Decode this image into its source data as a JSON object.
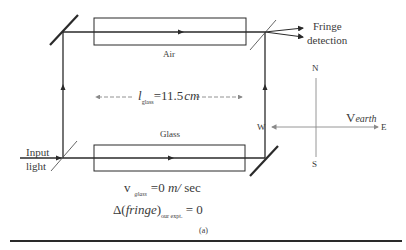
{
  "figure": {
    "labels": {
      "air": "Air",
      "glass": "Glass",
      "fringe_line1": "Fringe",
      "fringe_line2": "detection",
      "input_line1": "Input",
      "input_line2": "light",
      "length_symbol": "l",
      "length_sub": "glass",
      "length_value": "=11.5",
      "length_unit": "cm",
      "v_glass_symbol": "v",
      "v_glass_sub": "glass",
      "v_glass_value": "=0",
      "v_glass_unit": "m/",
      "v_glass_unit2": "sec",
      "delta_prefix": "Δ(",
      "delta_word": "fringe",
      "delta_suffix": ")",
      "delta_sub": "our expt.",
      "delta_value": "= 0",
      "caption": "(a)"
    },
    "compass": {
      "north": "N",
      "south": "S",
      "east": "E",
      "west": "W",
      "velocity_symbol": "V",
      "velocity_sub": "earth"
    },
    "colors": {
      "line": "#2a2a2a",
      "compass": "#8a8a8a",
      "text": "#3a3a3a"
    }
  }
}
